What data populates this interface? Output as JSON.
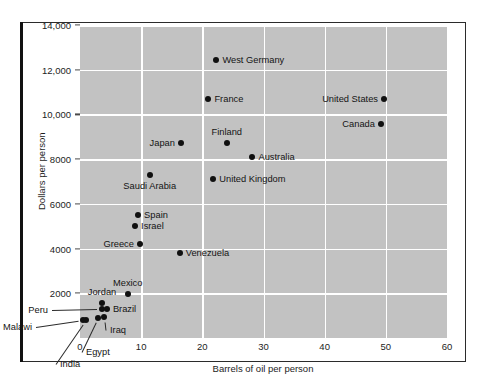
{
  "chart_data": {
    "type": "scatter",
    "title": "",
    "xlabel": "Barrels of oil per person",
    "ylabel": "Dollars per person",
    "xlim": [
      0,
      60
    ],
    "ylim": [
      0,
      14000
    ],
    "xticks": [
      "0",
      "10",
      "20",
      "30",
      "40",
      "50",
      "60"
    ],
    "xtick_values": [
      0,
      10,
      20,
      30,
      40,
      50,
      60
    ],
    "yticks": [
      "2000",
      "4000",
      "6000",
      "8000",
      "10,000",
      "12,000",
      "14,000"
    ],
    "ytick_values": [
      2000,
      4000,
      6000,
      8000,
      10000,
      12000,
      14000
    ],
    "grid": true,
    "legend": "none",
    "points": [
      {
        "label": "West Germany",
        "x": 22.3,
        "y": 12450,
        "label_side": "right"
      },
      {
        "label": "France",
        "x": 21.0,
        "y": 10700,
        "label_side": "right"
      },
      {
        "label": "United States",
        "x": 49.7,
        "y": 10700,
        "label_side": "left"
      },
      {
        "label": "Canada",
        "x": 49.2,
        "y": 9550,
        "label_side": "left"
      },
      {
        "label": "Finland",
        "x": 24.0,
        "y": 8700,
        "label_side": "above"
      },
      {
        "label": "Japan",
        "x": 16.5,
        "y": 8700,
        "label_side": "left"
      },
      {
        "label": "Australia",
        "x": 28.2,
        "y": 8100,
        "label_side": "right"
      },
      {
        "label": "United Kingdom",
        "x": 21.8,
        "y": 7100,
        "label_side": "right"
      },
      {
        "label": "Saudi Arabia",
        "x": 11.4,
        "y": 7300,
        "label_side": "below"
      },
      {
        "label": "Spain",
        "x": 9.5,
        "y": 5500,
        "label_side": "right"
      },
      {
        "label": "Israel",
        "x": 9.0,
        "y": 5000,
        "label_side": "right"
      },
      {
        "label": "Greece",
        "x": 9.8,
        "y": 4200,
        "label_side": "left"
      },
      {
        "label": "Venezuela",
        "x": 16.3,
        "y": 3800,
        "label_side": "right"
      },
      {
        "label": "Mexico",
        "x": 7.8,
        "y": 1950,
        "label_side": "above"
      },
      {
        "label": "Jordan",
        "x": 3.6,
        "y": 1550,
        "label_side": "above"
      },
      {
        "label": "Brazil",
        "x": 4.4,
        "y": 1300,
        "label_side": "right"
      },
      {
        "label": "Peru",
        "x": 3.6,
        "y": 1300,
        "label_side": "leader-left"
      },
      {
        "label": "Iraq",
        "x": 4.0,
        "y": 950,
        "label_side": "leader-right"
      },
      {
        "label": "Egypt",
        "x": 3.0,
        "y": 900,
        "label_side": "leader-below"
      },
      {
        "label": "India",
        "x": 1.0,
        "y": 800,
        "label_side": "leader-below"
      },
      {
        "label": "Malawi",
        "x": 0.5,
        "y": 800,
        "label_side": "leader-left"
      }
    ],
    "colors": {
      "panel_background": "#c2c2c2",
      "gridline": "#ffffff",
      "marker": "#101010",
      "text": "#141414",
      "frame": "#2b2b2b"
    }
  }
}
